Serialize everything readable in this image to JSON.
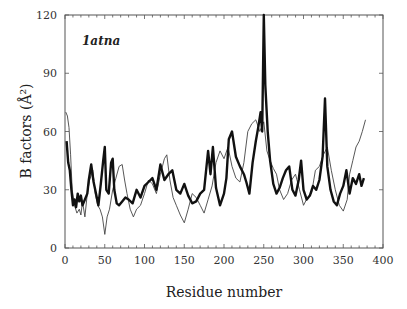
{
  "chart_data": {
    "type": "line",
    "title": "",
    "panel_label": "1atna",
    "xlabel": "Residue number",
    "ylabel": "B factors (Å²)",
    "xlim": [
      0,
      400
    ],
    "ylim": [
      0,
      120
    ],
    "x_ticks": [
      0,
      50,
      100,
      150,
      200,
      250,
      300,
      350,
      400
    ],
    "y_ticks": [
      0,
      30,
      60,
      90,
      120
    ],
    "grid": false,
    "legend": null,
    "series": [
      {
        "name": "thick",
        "style": "thick-black",
        "x": [
          2,
          4,
          6,
          8,
          10,
          12,
          14,
          16,
          18,
          20,
          22,
          25,
          28,
          30,
          33,
          36,
          39,
          42,
          45,
          48,
          50,
          52,
          55,
          58,
          60,
          62,
          65,
          68,
          72,
          76,
          80,
          85,
          90,
          95,
          100,
          105,
          110,
          115,
          120,
          125,
          130,
          135,
          140,
          145,
          150,
          155,
          160,
          165,
          170,
          175,
          180,
          183,
          186,
          190,
          195,
          200,
          203,
          206,
          210,
          215,
          220,
          225,
          228,
          232,
          236,
          240,
          243,
          246,
          248,
          250,
          252,
          255,
          258,
          262,
          266,
          270,
          274,
          278,
          282,
          286,
          290,
          294,
          297,
          300,
          304,
          308,
          312,
          316,
          320,
          324,
          327,
          330,
          334,
          338,
          342,
          346,
          350,
          354,
          358,
          362,
          366,
          370,
          373,
          376
        ],
        "y": [
          55,
          44,
          40,
          30,
          22,
          25,
          21,
          28,
          24,
          27,
          22,
          25,
          28,
          35,
          43,
          34,
          28,
          22,
          33,
          45,
          52,
          30,
          28,
          44,
          46,
          30,
          23,
          22,
          24,
          26,
          25,
          23,
          30,
          26,
          32,
          34,
          36,
          30,
          43,
          35,
          38,
          40,
          30,
          28,
          33,
          27,
          23,
          24,
          28,
          30,
          50,
          38,
          52,
          31,
          22,
          28,
          36,
          56,
          60,
          47,
          42,
          38,
          34,
          28,
          44,
          55,
          62,
          70,
          60,
          120,
          84,
          60,
          45,
          33,
          28,
          31,
          36,
          40,
          42,
          30,
          27,
          35,
          45,
          30,
          25,
          27,
          32,
          30,
          35,
          47,
          77,
          42,
          30,
          24,
          22,
          28,
          32,
          40,
          28,
          36,
          33,
          38,
          32,
          36
        ]
      },
      {
        "name": "thin",
        "style": "thin-black",
        "x": [
          1,
          3,
          5,
          7,
          9,
          12,
          15,
          18,
          20,
          22,
          25,
          28,
          31,
          35,
          38,
          41,
          44,
          47,
          50,
          53,
          56,
          60,
          64,
          68,
          72,
          75,
          78,
          82,
          86,
          90,
          95,
          100,
          105,
          110,
          115,
          120,
          125,
          128,
          132,
          136,
          140,
          145,
          150,
          155,
          160,
          165,
          170,
          175,
          180,
          185,
          190,
          195,
          200,
          205,
          210,
          215,
          220,
          225,
          230,
          235,
          240,
          245,
          250,
          254,
          258,
          262,
          266,
          270,
          275,
          280,
          285,
          290,
          295,
          300,
          305,
          310,
          315,
          320,
          325,
          330,
          335,
          340,
          345,
          350,
          355,
          358,
          362,
          366,
          370,
          374,
          378
        ],
        "y": [
          70,
          68,
          62,
          48,
          30,
          22,
          18,
          20,
          17,
          24,
          16,
          28,
          35,
          40,
          28,
          22,
          20,
          16,
          7,
          16,
          20,
          30,
          36,
          42,
          43,
          35,
          28,
          20,
          16,
          20,
          22,
          28,
          35,
          33,
          28,
          38,
          46,
          48,
          35,
          26,
          22,
          17,
          13,
          20,
          28,
          26,
          22,
          18,
          25,
          32,
          44,
          50,
          46,
          52,
          42,
          36,
          34,
          44,
          60,
          64,
          66,
          60,
          65,
          50,
          45,
          41,
          38,
          30,
          25,
          28,
          35,
          38,
          30,
          22,
          26,
          28,
          40,
          42,
          48,
          52,
          40,
          30,
          22,
          19,
          25,
          38,
          45,
          52,
          55,
          60,
          66
        ]
      }
    ]
  }
}
